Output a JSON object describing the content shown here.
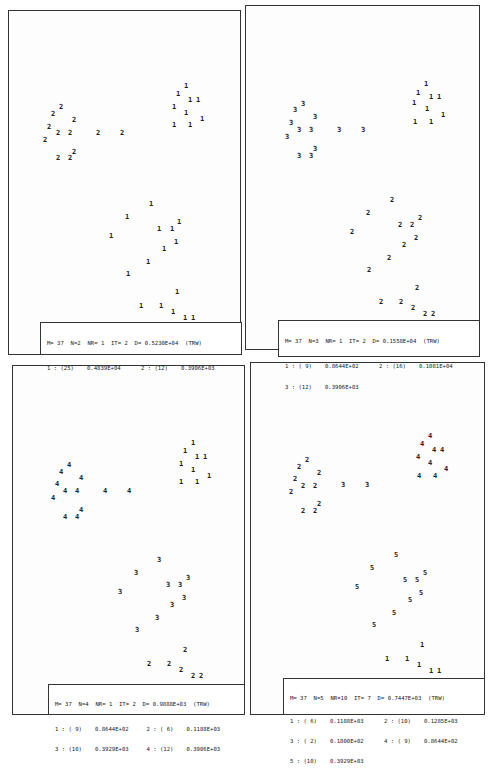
{
  "chart_data": [
    {
      "type": "scatter",
      "title": "M= 37  N=2  NR= 1  IT= 2  D= 0.5230E+04  (TRW)",
      "header": {
        "M": "37",
        "N": "2",
        "NR": "1",
        "IT": "2",
        "D": "0.5230E+04",
        "tag": "(TRW)"
      },
      "clusters": [
        {
          "id": "1",
          "count": "(25)",
          "value": "0.4839E+04"
        },
        {
          "id": "2",
          "count": "(12)",
          "value": "0.3906E+03"
        }
      ],
      "points": [
        {
          "x": 61,
          "y": 107,
          "label": "2"
        },
        {
          "x": 53,
          "y": 114,
          "label": "2"
        },
        {
          "x": 74,
          "y": 120,
          "label": "2"
        },
        {
          "x": 49,
          "y": 127,
          "label": "2"
        },
        {
          "x": 58,
          "y": 133,
          "label": "2"
        },
        {
          "x": 70,
          "y": 133,
          "label": "2"
        },
        {
          "x": 45,
          "y": 140,
          "label": "2"
        },
        {
          "x": 98,
          "y": 133,
          "label": "2"
        },
        {
          "x": 122,
          "y": 133,
          "label": "2"
        },
        {
          "x": 74,
          "y": 152,
          "label": "2"
        },
        {
          "x": 58,
          "y": 158,
          "label": "2"
        },
        {
          "x": 70,
          "y": 158,
          "label": "2"
        },
        {
          "x": 186,
          "y": 86,
          "label": "1"
        },
        {
          "x": 178,
          "y": 94,
          "label": "1"
        },
        {
          "x": 190,
          "y": 100,
          "label": "1"
        },
        {
          "x": 198,
          "y": 100,
          "label": "1"
        },
        {
          "x": 174,
          "y": 107,
          "label": "1"
        },
        {
          "x": 186,
          "y": 113,
          "label": "1"
        },
        {
          "x": 202,
          "y": 119,
          "label": "1"
        },
        {
          "x": 174,
          "y": 125,
          "label": "1"
        },
        {
          "x": 190,
          "y": 125,
          "label": "1"
        },
        {
          "x": 151,
          "y": 204,
          "label": "1"
        },
        {
          "x": 127,
          "y": 217,
          "label": "1"
        },
        {
          "x": 179,
          "y": 222,
          "label": "1"
        },
        {
          "x": 159,
          "y": 229,
          "label": "1"
        },
        {
          "x": 172,
          "y": 229,
          "label": "1"
        },
        {
          "x": 111,
          "y": 236,
          "label": "1"
        },
        {
          "x": 176,
          "y": 242,
          "label": "1"
        },
        {
          "x": 164,
          "y": 249,
          "label": "1"
        },
        {
          "x": 148,
          "y": 262,
          "label": "1"
        },
        {
          "x": 128,
          "y": 274,
          "label": "1"
        },
        {
          "x": 177,
          "y": 292,
          "label": "1"
        },
        {
          "x": 141,
          "y": 306,
          "label": "1"
        },
        {
          "x": 161,
          "y": 306,
          "label": "1"
        },
        {
          "x": 173,
          "y": 312,
          "label": "1"
        },
        {
          "x": 185,
          "y": 318,
          "label": "1"
        },
        {
          "x": 193,
          "y": 318,
          "label": "1"
        }
      ]
    },
    {
      "type": "scatter",
      "title": "M= 37  N=3  NR= 1  IT= 2  D= 0.1558E+04  (TRW)",
      "header": {
        "M": "37",
        "N": "3",
        "NR": "1",
        "IT": "2",
        "D": "0.1558E+04",
        "tag": "(TRW)"
      },
      "clusters": [
        {
          "id": "1",
          "count": "( 9)",
          "value": "0.8644E+02"
        },
        {
          "id": "2",
          "count": "(16)",
          "value": "0.1081E+04"
        },
        {
          "id": "3",
          "count": "(12)",
          "value": "0.3906E+03"
        }
      ],
      "points": [
        {
          "x": 303,
          "y": 104,
          "label": "3"
        },
        {
          "x": 295,
          "y": 110,
          "label": "3"
        },
        {
          "x": 315,
          "y": 117,
          "label": "3"
        },
        {
          "x": 291,
          "y": 123,
          "label": "3"
        },
        {
          "x": 299,
          "y": 130,
          "label": "3"
        },
        {
          "x": 311,
          "y": 130,
          "label": "3"
        },
        {
          "x": 287,
          "y": 137,
          "label": "3"
        },
        {
          "x": 339,
          "y": 130,
          "label": "3"
        },
        {
          "x": 363,
          "y": 130,
          "label": "3"
        },
        {
          "x": 315,
          "y": 149,
          "label": "3"
        },
        {
          "x": 299,
          "y": 156,
          "label": "3"
        },
        {
          "x": 311,
          "y": 156,
          "label": "3"
        },
        {
          "x": 426,
          "y": 84,
          "label": "1"
        },
        {
          "x": 418,
          "y": 93,
          "label": "1"
        },
        {
          "x": 431,
          "y": 97,
          "label": "1"
        },
        {
          "x": 439,
          "y": 97,
          "label": "1"
        },
        {
          "x": 414,
          "y": 103,
          "label": "1"
        },
        {
          "x": 427,
          "y": 109,
          "label": "1"
        },
        {
          "x": 443,
          "y": 115,
          "label": "1"
        },
        {
          "x": 415,
          "y": 122,
          "label": "1"
        },
        {
          "x": 431,
          "y": 122,
          "label": "1"
        },
        {
          "x": 392,
          "y": 200,
          "label": "2"
        },
        {
          "x": 368,
          "y": 213,
          "label": "2"
        },
        {
          "x": 420,
          "y": 218,
          "label": "2"
        },
        {
          "x": 400,
          "y": 225,
          "label": "2"
        },
        {
          "x": 412,
          "y": 225,
          "label": "2"
        },
        {
          "x": 352,
          "y": 232,
          "label": "2"
        },
        {
          "x": 416,
          "y": 238,
          "label": "2"
        },
        {
          "x": 404,
          "y": 245,
          "label": "2"
        },
        {
          "x": 389,
          "y": 258,
          "label": "2"
        },
        {
          "x": 369,
          "y": 270,
          "label": "2"
        },
        {
          "x": 417,
          "y": 288,
          "label": "2"
        },
        {
          "x": 381,
          "y": 302,
          "label": "2"
        },
        {
          "x": 401,
          "y": 302,
          "label": "2"
        },
        {
          "x": 413,
          "y": 308,
          "label": "2"
        },
        {
          "x": 425,
          "y": 314,
          "label": "2"
        },
        {
          "x": 433,
          "y": 314,
          "label": "2"
        }
      ]
    },
    {
      "type": "scatter",
      "title": "M= 37  N=4  NR= 1  IT= 2  D= 0.9888E+03  (TRW)",
      "header": {
        "M": "37",
        "N": "4",
        "NR": "1",
        "IT": "2",
        "D": "0.9888E+03",
        "tag": "(TRW)"
      },
      "clusters": [
        {
          "id": "1",
          "count": "( 9)",
          "value": "0.8644E+02"
        },
        {
          "id": "2",
          "count": "( 6)",
          "value": "0.1188E+03"
        },
        {
          "id": "3",
          "count": "(10)",
          "value": "0.3929E+03"
        },
        {
          "id": "4",
          "count": "(12)",
          "value": "0.3906E+03"
        }
      ],
      "points": [
        {
          "x": 69,
          "y": 465,
          "label": "4"
        },
        {
          "x": 61,
          "y": 472,
          "label": "4"
        },
        {
          "x": 81,
          "y": 478,
          "label": "4"
        },
        {
          "x": 57,
          "y": 484,
          "label": "4"
        },
        {
          "x": 65,
          "y": 491,
          "label": "4"
        },
        {
          "x": 77,
          "y": 491,
          "label": "4"
        },
        {
          "x": 53,
          "y": 498,
          "label": "4"
        },
        {
          "x": 105,
          "y": 491,
          "label": "4"
        },
        {
          "x": 129,
          "y": 491,
          "label": "4"
        },
        {
          "x": 81,
          "y": 510,
          "label": "4"
        },
        {
          "x": 65,
          "y": 517,
          "label": "4"
        },
        {
          "x": 77,
          "y": 517,
          "label": "4"
        },
        {
          "x": 193,
          "y": 443,
          "label": "1"
        },
        {
          "x": 185,
          "y": 451,
          "label": "1"
        },
        {
          "x": 197,
          "y": 457,
          "label": "1"
        },
        {
          "x": 205,
          "y": 457,
          "label": "1"
        },
        {
          "x": 181,
          "y": 464,
          "label": "1"
        },
        {
          "x": 193,
          "y": 470,
          "label": "1"
        },
        {
          "x": 209,
          "y": 476,
          "label": "1"
        },
        {
          "x": 181,
          "y": 482,
          "label": "1"
        },
        {
          "x": 197,
          "y": 482,
          "label": "1"
        },
        {
          "x": 159,
          "y": 560,
          "label": "3"
        },
        {
          "x": 136,
          "y": 573,
          "label": "3"
        },
        {
          "x": 188,
          "y": 578,
          "label": "3"
        },
        {
          "x": 168,
          "y": 585,
          "label": "3"
        },
        {
          "x": 180,
          "y": 585,
          "label": "3"
        },
        {
          "x": 120,
          "y": 592,
          "label": "3"
        },
        {
          "x": 184,
          "y": 598,
          "label": "3"
        },
        {
          "x": 172,
          "y": 605,
          "label": "3"
        },
        {
          "x": 157,
          "y": 618,
          "label": "3"
        },
        {
          "x": 137,
          "y": 630,
          "label": "3"
        },
        {
          "x": 185,
          "y": 650,
          "label": "2"
        },
        {
          "x": 149,
          "y": 664,
          "label": "2"
        },
        {
          "x": 169,
          "y": 664,
          "label": "2"
        },
        {
          "x": 181,
          "y": 670,
          "label": "2"
        },
        {
          "x": 193,
          "y": 676,
          "label": "2"
        },
        {
          "x": 201,
          "y": 676,
          "label": "2"
        }
      ]
    },
    {
      "type": "scatter",
      "title": "M= 37  N=5  NR=10  IT= 7  D= 0.7447E+03  (TRW)",
      "header": {
        "M": "37",
        "N": "5",
        "NR": "10",
        "IT": "7",
        "D": "0.7447E+03",
        "tag": "(TRW)"
      },
      "clusters": [
        {
          "id": "1",
          "count": "( 6)",
          "value": "0.1188E+03"
        },
        {
          "id": "2",
          "count": "(10)",
          "value": "0.1285E+03"
        },
        {
          "id": "3",
          "count": "( 2)",
          "value": "0.1800E+02"
        },
        {
          "id": "4",
          "count": "( 9)",
          "value": "0.8644E+02"
        },
        {
          "id": "5",
          "count": "(10)",
          "value": "0.3929E+03"
        }
      ],
      "points": [
        {
          "x": 307,
          "y": 460,
          "label": "2"
        },
        {
          "x": 299,
          "y": 467,
          "label": "2"
        },
        {
          "x": 319,
          "y": 473,
          "label": "2"
        },
        {
          "x": 295,
          "y": 479,
          "label": "2"
        },
        {
          "x": 303,
          "y": 486,
          "label": "2"
        },
        {
          "x": 315,
          "y": 486,
          "label": "2"
        },
        {
          "x": 291,
          "y": 492,
          "label": "2"
        },
        {
          "x": 343,
          "y": 485,
          "label": "3"
        },
        {
          "x": 367,
          "y": 485,
          "label": "3"
        },
        {
          "x": 319,
          "y": 504,
          "label": "2"
        },
        {
          "x": 303,
          "y": 511,
          "label": "2"
        },
        {
          "x": 315,
          "y": 511,
          "label": "2"
        },
        {
          "x": 430,
          "y": 436,
          "label": "4"
        },
        {
          "x": 422,
          "y": 444,
          "label": "4"
        },
        {
          "x": 434,
          "y": 450,
          "label": "4"
        },
        {
          "x": 442,
          "y": 450,
          "label": "4"
        },
        {
          "x": 418,
          "y": 457,
          "label": "4"
        },
        {
          "x": 430,
          "y": 463,
          "label": "4"
        },
        {
          "x": 446,
          "y": 469,
          "label": "4"
        },
        {
          "x": 419,
          "y": 476,
          "label": "4"
        },
        {
          "x": 435,
          "y": 476,
          "label": "4"
        },
        {
          "x": 396,
          "y": 555,
          "label": "5"
        },
        {
          "x": 372,
          "y": 568,
          "label": "5"
        },
        {
          "x": 425,
          "y": 573,
          "label": "5"
        },
        {
          "x": 405,
          "y": 580,
          "label": "5"
        },
        {
          "x": 417,
          "y": 580,
          "label": "5"
        },
        {
          "x": 357,
          "y": 587,
          "label": "5"
        },
        {
          "x": 421,
          "y": 593,
          "label": "5"
        },
        {
          "x": 410,
          "y": 600,
          "label": "5"
        },
        {
          "x": 394,
          "y": 613,
          "label": "5"
        },
        {
          "x": 374,
          "y": 625,
          "label": "5"
        },
        {
          "x": 422,
          "y": 645,
          "label": "1"
        },
        {
          "x": 387,
          "y": 659,
          "label": "1"
        },
        {
          "x": 407,
          "y": 659,
          "label": "1"
        },
        {
          "x": 419,
          "y": 665,
          "label": "1"
        },
        {
          "x": 431,
          "y": 671,
          "label": "1"
        },
        {
          "x": 439,
          "y": 671,
          "label": "1"
        }
      ]
    }
  ],
  "panels": [
    {
      "header": "M= 37  N=2  NR= 1  IT= 2  D= 0.5230E+04  (TRW)",
      "rows": [
        [
          {
            "lab": "1 : (25)",
            "val": "0.4839E+04"
          },
          {
            "lab": "2 : (12)",
            "val": "0.3906E+03"
          }
        ]
      ]
    },
    {
      "header": "M= 37  N=3  NR= 1  IT= 2  D= 0.1558E+04  (TRW)",
      "rows": [
        [
          {
            "lab": "1 : ( 9)",
            "val": "0.8644E+02"
          },
          {
            "lab": "2 : (16)",
            "val": "0.1081E+04"
          }
        ],
        [
          {
            "lab": "3 : (12)",
            "val": "0.3906E+03"
          },
          {
            "lab": "",
            "val": ""
          }
        ]
      ]
    },
    {
      "header": "M= 37  N=4  NR= 1  IT= 2  D= 0.9888E+03  (TRW)",
      "rows": [
        [
          {
            "lab": "1 : ( 9)",
            "val": "0.8644E+02"
          },
          {
            "lab": "2 : ( 6)",
            "val": "0.1188E+03"
          }
        ],
        [
          {
            "lab": "3 : (10)",
            "val": "0.3929E+03"
          },
          {
            "lab": "4 : (12)",
            "val": "0.3906E+03"
          }
        ]
      ]
    },
    {
      "header": "M= 37  N=5  NR=10  IT= 7  D= 0.7447E+03  (TRW)",
      "rows": [
        [
          {
            "lab": "1 : ( 6)",
            "val": "0.1188E+03"
          },
          {
            "lab": "2 : (10)",
            "val": "0.1285E+03"
          }
        ],
        [
          {
            "lab": "3 : ( 2)",
            "val": "0.1800E+02"
          },
          {
            "lab": "4 : ( 9)",
            "val": "0.8644E+02"
          }
        ],
        [
          {
            "lab": "5 : (10)",
            "val": "0.3929E+03"
          },
          {
            "lab": "",
            "val": ""
          }
        ]
      ]
    }
  ]
}
